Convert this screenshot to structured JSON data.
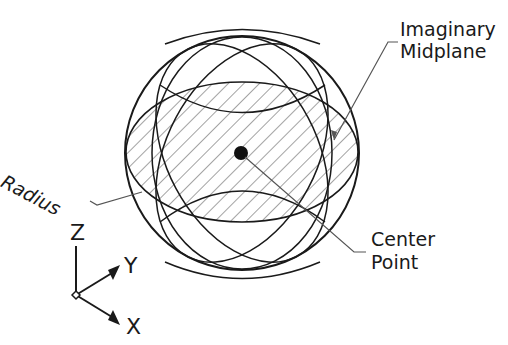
{
  "diagram": {
    "colors": {
      "line": "#1a1a1a",
      "hatch": "#4a4a4a",
      "leader": "#555555",
      "background": "#ffffff"
    },
    "labels": {
      "midplane_line1": "Imaginary",
      "midplane_line2": "Midplane",
      "radius": "Radius",
      "center_line1": "Center",
      "center_line2": "Point"
    },
    "axes": {
      "z": "Z",
      "y": "Y",
      "x": "X"
    },
    "sphere": {
      "cx": 242,
      "cy": 153,
      "r": 117
    },
    "midplane": {
      "cx": 242,
      "cy": 152,
      "rx": 116,
      "ry": 70,
      "hatched": true
    }
  }
}
